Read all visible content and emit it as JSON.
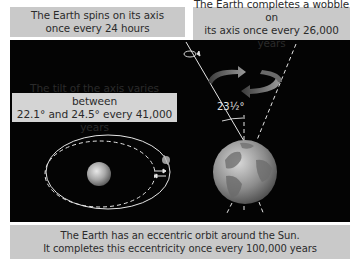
{
  "labels": {
    "spin": [
      "The Earth spins on its axis",
      "once every 24 hours"
    ],
    "wobble": [
      "The Earth completes a wobble on",
      "its axis once every 26,000 years"
    ],
    "tilt": [
      "The tilt of the axis varies between",
      "22.1° and 24.5° every 41,000 years"
    ],
    "eccentricity": [
      "The Earth has an eccentric orbit around the Sun.",
      "It completes this eccentricity once every 100,000 years"
    ]
  },
  "diagram": {
    "axial_tilt_label": "23½°",
    "icons": [
      "sun-icon",
      "earth-globe-icon",
      "orbit-earth-icon",
      "precession-arrows-icon",
      "spin-arrow-icon",
      "shift-arrows-icon"
    ]
  },
  "colors": {
    "panel_background": "#040404",
    "label_background": "#c9c9c9",
    "label_text": "#2b2b2b",
    "line_color": "#e6e6e6"
  }
}
